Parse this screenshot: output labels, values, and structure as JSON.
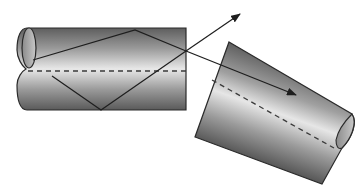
{
  "diagram": {
    "colors": {
      "background": "#ffffff",
      "fiber_dark": "#5a5a5a",
      "fiber_light": "#e6e6e6",
      "outline": "#2a2a2a",
      "ray": "#2a2a2a",
      "axis_dash": "#3a3a3a"
    },
    "fibers": [
      {
        "id": "input-fiber",
        "label": "Input fiber"
      },
      {
        "id": "output-fiber",
        "label": "Output fiber (tilted)"
      }
    ],
    "rays": [
      {
        "id": "guided-ray",
        "label": "Guided ray (zigzag by total internal reflection)"
      },
      {
        "id": "escaping-ray",
        "label": "Escaping ray"
      },
      {
        "id": "coupled-ray",
        "label": "Coupled ray"
      }
    ]
  }
}
